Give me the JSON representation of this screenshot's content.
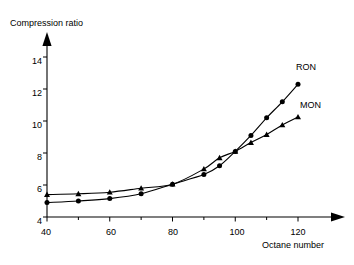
{
  "chart_data": {
    "type": "line",
    "title": "",
    "xlabel": "Octane number",
    "ylabel": "Compression ratio",
    "xlim": [
      40,
      128
    ],
    "ylim": [
      4,
      15
    ],
    "grid": false,
    "legend_position": "inline-right-end",
    "x_ticks": [
      40,
      60,
      80,
      100,
      120
    ],
    "x_minor_ticks": [
      50,
      70,
      90,
      110
    ],
    "y_ticks": [
      4,
      6,
      8,
      10,
      12,
      14
    ],
    "series": [
      {
        "name": "RON",
        "marker": "circle",
        "x": [
          40,
          50,
          60,
          70,
          80,
          90,
          95,
          100,
          105,
          110,
          115,
          120
        ],
        "values": [
          4.9,
          5.0,
          5.15,
          5.45,
          6.05,
          6.65,
          7.2,
          8.1,
          9.1,
          10.2,
          11.2,
          12.3
        ]
      },
      {
        "name": "MON",
        "marker": "triangle",
        "x": [
          40,
          50,
          60,
          70,
          80,
          90,
          95,
          100,
          105,
          110,
          115,
          120
        ],
        "values": [
          5.4,
          5.45,
          5.55,
          5.8,
          6.05,
          7.0,
          7.7,
          8.1,
          8.65,
          9.15,
          9.75,
          10.25
        ]
      }
    ],
    "annotations": [
      {
        "text": "RON",
        "x": 121,
        "y": 13.2
      },
      {
        "text": "MON",
        "x": 122,
        "y": 10.9
      }
    ]
  },
  "axis": {
    "y_title": "Compression ratio",
    "x_title": "Octane number",
    "y_tick_labels": [
      "14",
      "12",
      "10",
      "8",
      "6",
      "4"
    ],
    "x_tick_labels": [
      "40",
      "60",
      "80",
      "100",
      "120"
    ]
  },
  "labels": {
    "ron": "RON",
    "mon": "MON"
  },
  "colors": {
    "axis": "#000000",
    "line": "#000000",
    "background": "#ffffff"
  }
}
